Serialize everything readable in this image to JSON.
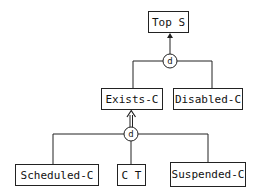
{
  "diagram": {
    "type": "specialization-hierarchy",
    "nodes": {
      "top": {
        "label": "Top S"
      },
      "exists": {
        "label": "Exists-C"
      },
      "disabled": {
        "label": "Disabled-C"
      },
      "scheduled": {
        "label": "Scheduled-C"
      },
      "ct": {
        "label": "C T"
      },
      "suspended": {
        "label": "Suspended-C"
      }
    },
    "connectors": {
      "upper_disjoint": {
        "label": "d"
      },
      "lower_disjoint": {
        "label": "d"
      }
    },
    "edges": [
      {
        "from": "upper_disjoint",
        "to": "top",
        "style": "arrow"
      },
      {
        "from": "exists",
        "to": "upper_disjoint",
        "style": "line"
      },
      {
        "from": "disabled",
        "to": "upper_disjoint",
        "style": "line"
      },
      {
        "from": "lower_disjoint",
        "to": "exists",
        "style": "double-arrow"
      },
      {
        "from": "scheduled",
        "to": "lower_disjoint",
        "style": "line"
      },
      {
        "from": "ct",
        "to": "lower_disjoint",
        "style": "line"
      },
      {
        "from": "suspended",
        "to": "lower_disjoint",
        "style": "line"
      }
    ],
    "colors": {
      "stroke": "#222222",
      "background": "#ffffff"
    }
  }
}
